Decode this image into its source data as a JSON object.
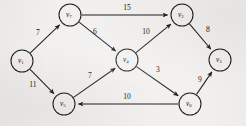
{
  "figure": {
    "kind": "directed-weighted-graph",
    "background_color": "#f2f0ee",
    "ink_color": "#1b1b1b"
  },
  "nodes": [
    {
      "id": "v1",
      "label": "v",
      "sub": "1",
      "cx": 22,
      "cy": 61,
      "r": 11
    },
    {
      "id": "v7",
      "label": "v",
      "sub": "7",
      "cx": 70,
      "cy": 15,
      "r": 11
    },
    {
      "id": "v2",
      "label": "v",
      "sub": "2",
      "cx": 182,
      "cy": 15,
      "r": 11
    },
    {
      "id": "v3",
      "label": "v",
      "sub": "3",
      "cx": 220,
      "cy": 60,
      "r": 11
    },
    {
      "id": "v4",
      "label": "v",
      "sub": "4",
      "cx": 127,
      "cy": 60,
      "r": 11
    },
    {
      "id": "v5",
      "label": "v",
      "sub": "5",
      "cx": 64,
      "cy": 104,
      "r": 11
    },
    {
      "id": "v6",
      "label": "v",
      "sub": "6",
      "cx": 190,
      "cy": 104,
      "r": 11
    }
  ],
  "edges": [
    {
      "id": "e-v1-v7",
      "from": "v1",
      "to": "v7",
      "weight": "7",
      "wx": 38,
      "wy": 33
    },
    {
      "id": "e-v1-v5",
      "from": "v1",
      "to": "v5",
      "weight": "11",
      "wx": 33,
      "wy": 85
    },
    {
      "id": "e-v7-v2",
      "from": "v7",
      "to": "v2",
      "weight": "15",
      "wx": 127,
      "wy": 8
    },
    {
      "id": "e-v7-v4",
      "from": "v7",
      "to": "v4",
      "weight": "6",
      "wx": 95,
      "wy": 32
    },
    {
      "id": "e-v4-v2",
      "from": "v4",
      "to": "v2",
      "weight": "10",
      "wx": 146,
      "wy": 32
    },
    {
      "id": "e-v2-v3",
      "from": "v2",
      "to": "v3",
      "weight": "8",
      "wx": 208,
      "wy": 30
    },
    {
      "id": "e-v4-v6",
      "from": "v4",
      "to": "v6",
      "weight": "3",
      "wx": 158,
      "wy": 70
    },
    {
      "id": "e-v5-v4",
      "from": "v5",
      "to": "v4",
      "weight": "7",
      "wx": 90,
      "wy": 76
    },
    {
      "id": "e-v6-v5",
      "from": "v6",
      "to": "v5",
      "weight": "10",
      "wx": 127,
      "wy": 97
    },
    {
      "id": "e-v6-v3",
      "from": "v6",
      "to": "v3",
      "weight": "9",
      "wx": 200,
      "wy": 80
    }
  ],
  "chart_data": {
    "type": "diagram",
    "title": "",
    "graph_type": "directed weighted graph",
    "vertices": [
      "v1",
      "v2",
      "v3",
      "v4",
      "v5",
      "v6",
      "v7"
    ],
    "vertex_labels": [
      "v₁",
      "v₂",
      "v₃",
      "v₄",
      "v₅",
      "v₆",
      "v₇"
    ],
    "edge_list": [
      {
        "source": "v1",
        "target": "v7",
        "weight": 7
      },
      {
        "source": "v1",
        "target": "v5",
        "weight": 11
      },
      {
        "source": "v7",
        "target": "v2",
        "weight": 15
      },
      {
        "source": "v7",
        "target": "v4",
        "weight": 6
      },
      {
        "source": "v4",
        "target": "v2",
        "weight": 10
      },
      {
        "source": "v2",
        "target": "v3",
        "weight": 8
      },
      {
        "source": "v4",
        "target": "v6",
        "weight": 3
      },
      {
        "source": "v5",
        "target": "v4",
        "weight": 7
      },
      {
        "source": "v6",
        "target": "v5",
        "weight": 10
      },
      {
        "source": "v6",
        "target": "v3",
        "weight": 9
      }
    ],
    "weights": [
      7,
      11,
      15,
      6,
      10,
      8,
      3,
      7,
      10,
      9
    ],
    "directed": true,
    "legend": []
  }
}
